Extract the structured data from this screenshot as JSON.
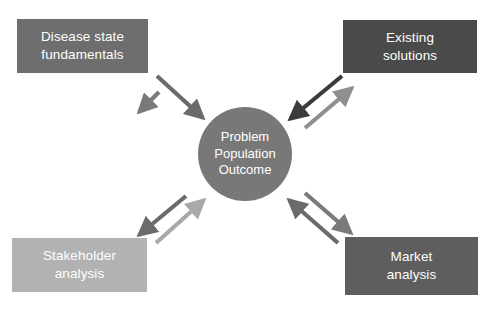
{
  "diagram": {
    "title_text_present": false,
    "background_color": "#ffffff",
    "canvas": {
      "width": 493,
      "height": 312
    },
    "hub": {
      "name": "problem-population-outcome",
      "lines": [
        "Problem",
        "Population",
        "Outcome"
      ],
      "fill": "#787878",
      "text_color": "#ffffff",
      "cx": 245,
      "cy": 154,
      "r": 47
    },
    "nodes": [
      {
        "id": "disease-state-fundamentals",
        "lines": [
          "Disease state",
          "fundamentals"
        ],
        "fill": "#6e6e6e",
        "text_color": "#ffffff",
        "x": 17,
        "y": 19,
        "w": 131,
        "h": 54,
        "position": "top-left"
      },
      {
        "id": "existing-solutions",
        "lines": [
          "Existing",
          "solutions"
        ],
        "fill": "#4a4a4a",
        "text_color": "#ffffff",
        "x": 343,
        "y": 20,
        "w": 134,
        "h": 53,
        "position": "top-right"
      },
      {
        "id": "stakeholder-analysis",
        "lines": [
          "Stakeholder",
          "analysis"
        ],
        "fill": "#b2b2b2",
        "text_color": "#ffffff",
        "x": 12,
        "y": 238,
        "w": 135,
        "h": 54,
        "position": "bottom-left"
      },
      {
        "id": "market-analysis",
        "lines": [
          "Market",
          "analysis"
        ],
        "fill": "#5e5e5e",
        "text_color": "#ffffff",
        "x": 345,
        "y": 237,
        "w": 133,
        "h": 58,
        "position": "bottom-right"
      }
    ],
    "connectors": [
      {
        "id": "hub-to-disease-state-fundamentals",
        "from": "problem-population-outcome",
        "to": "disease-state-fundamentals",
        "direction": "outbound",
        "color": "#7a7a7a",
        "x1": 159,
        "y1": 92,
        "x2": 139,
        "y2": 112
      },
      {
        "id": "disease-state-fundamentals-to-hub",
        "from": "disease-state-fundamentals",
        "to": "problem-population-outcome",
        "direction": "inbound",
        "color": "#6b6b6b",
        "x1": 157,
        "y1": 76,
        "x2": 203,
        "y2": 118
      },
      {
        "id": "existing-solutions-to-hub",
        "from": "existing-solutions",
        "to": "problem-population-outcome",
        "direction": "inbound",
        "color": "#3b3b3b",
        "x1": 342,
        "y1": 76,
        "x2": 290,
        "y2": 119
      },
      {
        "id": "hub-to-existing-solutions",
        "from": "problem-population-outcome",
        "to": "existing-solutions",
        "direction": "outbound",
        "color": "#8f8f8f",
        "x1": 305,
        "y1": 128,
        "x2": 352,
        "y2": 88
      },
      {
        "id": "hub-to-stakeholder-analysis",
        "from": "problem-population-outcome",
        "to": "stakeholder-analysis",
        "direction": "outbound",
        "color": "#6b6b6b",
        "x1": 186,
        "y1": 196,
        "x2": 139,
        "y2": 235
      },
      {
        "id": "stakeholder-analysis-to-hub",
        "from": "stakeholder-analysis",
        "to": "problem-population-outcome",
        "direction": "inbound",
        "color": "#a9a9a9",
        "x1": 156,
        "y1": 243,
        "x2": 204,
        "y2": 200
      },
      {
        "id": "market-analysis-to-hub",
        "from": "market-analysis",
        "to": "problem-population-outcome",
        "direction": "inbound",
        "color": "#6b6b6b",
        "x1": 338,
        "y1": 243,
        "x2": 289,
        "y2": 200
      },
      {
        "id": "hub-to-market-analysis",
        "from": "problem-population-outcome",
        "to": "market-analysis",
        "direction": "outbound",
        "color": "#7a7a7a",
        "x1": 305,
        "y1": 193,
        "x2": 351,
        "y2": 233
      }
    ]
  }
}
